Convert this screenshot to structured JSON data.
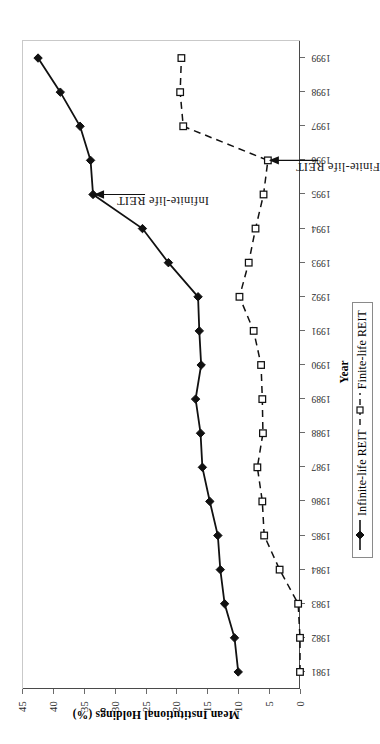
{
  "chart_data": {
    "type": "line",
    "title": "",
    "xlabel": "Year",
    "ylabel": "Mean Institutional Holdings (%)",
    "x": [
      1981,
      1982,
      1983,
      1984,
      1985,
      1986,
      1987,
      1988,
      1989,
      1990,
      1991,
      1992,
      1993,
      1994,
      1995,
      1996,
      1997,
      1998,
      1999
    ],
    "xtick_labels": [
      "1981",
      "1982",
      "1983",
      "1984",
      "1985",
      "1986",
      "1987",
      "1988",
      "1989",
      "1990",
      "1991",
      "1992",
      "1993",
      "1994",
      "1995",
      "1996",
      "1997",
      "1998",
      "1999"
    ],
    "ylim": [
      0,
      45
    ],
    "ytick_labels": [
      "0",
      "5",
      "10",
      "15",
      "20",
      "25",
      "30",
      "35",
      "40",
      "45"
    ],
    "ytick_values": [
      0,
      5,
      10,
      15,
      20,
      25,
      30,
      35,
      40,
      45
    ],
    "grid": false,
    "legend_position": "bottom-right",
    "series": [
      {
        "name": "Infinite-life REIT",
        "marker": "filled-diamond",
        "linestyle": "solid",
        "color": "#111111",
        "values": [
          10.0,
          10.6,
          12.2,
          12.9,
          13.3,
          14.6,
          15.8,
          16.1,
          16.9,
          16.0,
          16.3,
          16.5,
          21.3,
          25.5,
          33.5,
          33.9,
          35.6,
          38.8,
          42.4
        ]
      },
      {
        "name": "Finite-life REIT",
        "marker": "open-square",
        "linestyle": "dashed",
        "color": "#111111",
        "values": [
          0.0,
          0.0,
          0.3,
          3.3,
          5.8,
          6.1,
          6.9,
          6.0,
          6.1,
          6.3,
          7.5,
          9.8,
          8.3,
          7.2,
          5.9,
          5.2,
          18.9,
          19.4,
          19.2
        ]
      }
    ],
    "annotations": [
      {
        "text": "Infinite-life REIT",
        "points_to_year": 1995,
        "points_to_value": 33.5
      },
      {
        "text": "Finite-life REIT",
        "points_to_year": 1996,
        "points_to_value": 5.2
      }
    ]
  },
  "axes": {
    "x_title": "Year",
    "y_title": "Mean Institutional Holdings (%)"
  },
  "legend": {
    "entries": [
      {
        "label": "Infinite-life REIT",
        "marker": "filled-diamond",
        "linestyle": "solid"
      },
      {
        "label": "Finite-life REIT",
        "marker": "open-square",
        "linestyle": "dashed"
      }
    ]
  },
  "colors": {
    "ink": "#111111",
    "axis": "#4a4a4a",
    "background": "#ffffff"
  }
}
